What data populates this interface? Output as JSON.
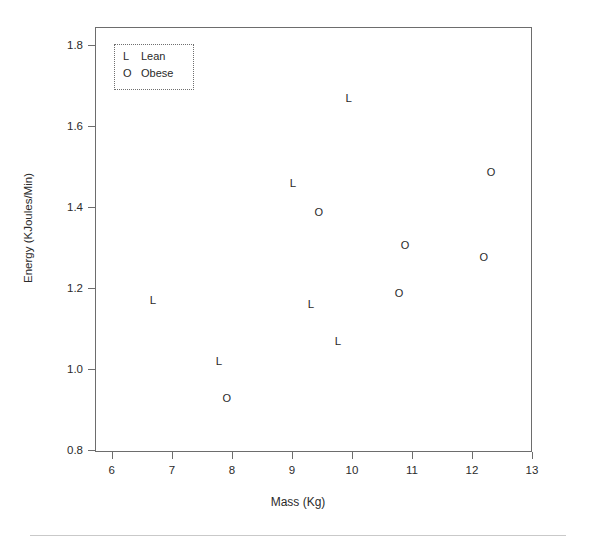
{
  "chart_data": {
    "type": "scatter",
    "title": "",
    "xlabel": "Mass (Kg)",
    "ylabel": "Energy (KJoules/Min)",
    "xlim": [
      5.72,
      13.0
    ],
    "ylim": [
      0.795,
      1.845
    ],
    "xticks": [
      "6",
      "7",
      "8",
      "9",
      "10",
      "11",
      "12",
      "13"
    ],
    "xtick_values": [
      6,
      7,
      8,
      9,
      10,
      11,
      12,
      13
    ],
    "yticks": [
      "0.8",
      "1.0",
      "1.2",
      "1.4",
      "1.6",
      "1.8"
    ],
    "ytick_values": [
      0.8,
      1.0,
      1.2,
      1.4,
      1.6,
      1.8
    ],
    "grid": false,
    "legend_position": "top-left",
    "series": [
      {
        "name": "Lean",
        "marker": "L",
        "points": [
          {
            "x": 6.67,
            "y": 1.17
          },
          {
            "x": 7.77,
            "y": 1.02
          },
          {
            "x": 9.0,
            "y": 1.46
          },
          {
            "x": 9.3,
            "y": 1.16
          },
          {
            "x": 9.75,
            "y": 1.07
          },
          {
            "x": 9.93,
            "y": 1.67
          }
        ]
      },
      {
        "name": "Obese",
        "marker": "O",
        "points": [
          {
            "x": 7.9,
            "y": 0.93
          },
          {
            "x": 9.43,
            "y": 1.39
          },
          {
            "x": 10.77,
            "y": 1.19
          },
          {
            "x": 10.87,
            "y": 1.31
          },
          {
            "x": 12.18,
            "y": 1.28
          },
          {
            "x": 12.3,
            "y": 1.49
          }
        ]
      }
    ]
  },
  "legend": {
    "entries": [
      {
        "symbol": "L",
        "label": "Lean"
      },
      {
        "symbol": "O",
        "label": "Obese"
      }
    ]
  },
  "colors": {
    "axis": "#6d6d6d",
    "text": "#2b2b2b",
    "marker": "#2a2a2a",
    "separator": "#c9c9c9",
    "background": "#ffffff"
  }
}
